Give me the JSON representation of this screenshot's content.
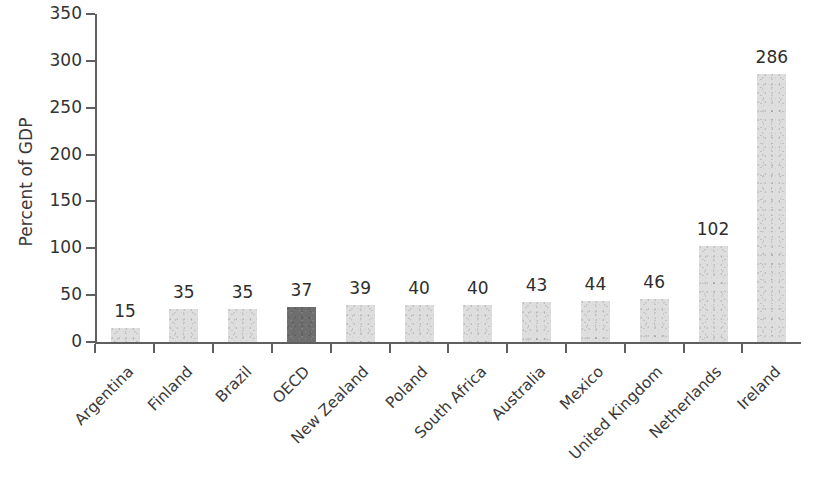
{
  "chart_data": {
    "type": "bar",
    "title": "",
    "subtitle": "",
    "xlabel": "",
    "ylabel": "Percent of GDP",
    "ylim": [
      0,
      350
    ],
    "y_ticks": [
      0,
      50,
      100,
      150,
      200,
      250,
      300,
      350
    ],
    "grid": false,
    "legend": null,
    "categories": [
      "Argentina",
      "Finland",
      "Brazil",
      "OECD",
      "New Zealand",
      "Poland",
      "South Africa",
      "Australia",
      "Mexico",
      "United Kingdom",
      "Netherlands",
      "Ireland"
    ],
    "values": [
      15,
      35,
      35,
      37,
      39,
      40,
      40,
      43,
      44,
      46,
      102,
      286
    ],
    "value_labels": [
      "15",
      "35",
      "35",
      "37",
      "39",
      "40",
      "40",
      "43",
      "44",
      "46",
      "102",
      "286"
    ],
    "highlighted_category": "OECD",
    "highlight_index": 3,
    "colors": {
      "bar": "#dedede",
      "bar_highlight": "#6e6e6e",
      "axis": "#5f5f5f",
      "text": "#2e2e2e"
    }
  }
}
